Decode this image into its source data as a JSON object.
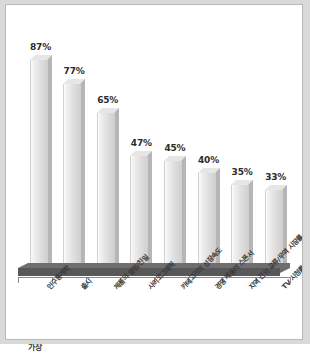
{
  "chart_data": {
    "type": "bar",
    "title": "",
    "subtitle": "",
    "xlabel": "",
    "ylabel": "",
    "ylim": [
      0,
      100
    ],
    "grid": false,
    "legend": "none",
    "value_suffix": "%",
    "categories": [
      "인구통계학",
      "출시",
      "제품의 열정/친밀",
      "사이코그래픽",
      "카테고리의 성장속도",
      "경쟁 제품의 스폰서",
      "지역 간의 교류/무역 시장률",
      "TV 시청률"
    ],
    "values": [
      87,
      77,
      65,
      47,
      45,
      40,
      35,
      33
    ],
    "value_labels": [
      "87%",
      "77%",
      "65%",
      "47%",
      "45%",
      "40%",
      "35%",
      "33%"
    ]
  },
  "figure": {
    "caption_partial": "가장"
  },
  "colors": {
    "page_background": "#d9d9d9",
    "panel_background": "#ffffff",
    "panel_border": "#b9b9b9",
    "bar_face_light": "#fbfbfb",
    "bar_face_dark": "#cfcfcf",
    "bar_side": "#b6b6b6",
    "bar_top": "#e6e6e6",
    "floor_top": "#6e6e6e",
    "floor_front": "#585858",
    "axis": "#8a8a8a",
    "value_text": "#2b2b2b",
    "category_text": "#3a3a3a"
  }
}
